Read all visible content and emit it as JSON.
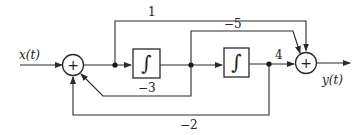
{
  "diagram": {
    "type": "block-diagram",
    "input_label": "x(t)",
    "output_label": "y(t)",
    "blocks": [
      {
        "id": "sum1",
        "kind": "summing-junction",
        "symbol": "+"
      },
      {
        "id": "int1",
        "kind": "integrator",
        "symbol": "∫"
      },
      {
        "id": "int2",
        "kind": "integrator",
        "symbol": "∫"
      },
      {
        "id": "sum2",
        "kind": "summing-junction",
        "symbol": "+"
      }
    ],
    "gains": {
      "feedforward_top": "1",
      "feedforward_mid": "−5",
      "forward_out": "4",
      "feedback_inner": "−3",
      "feedback_outer": "−2"
    }
  }
}
